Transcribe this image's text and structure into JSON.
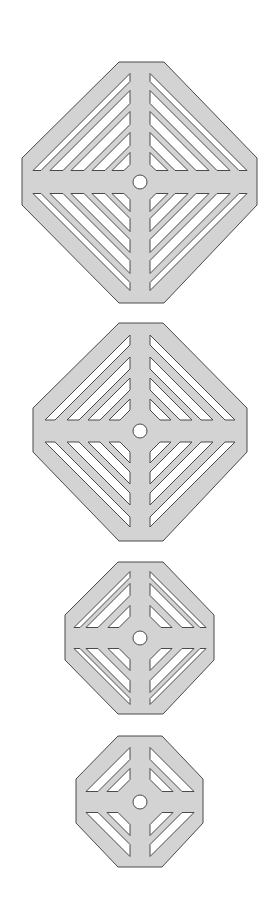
{
  "diagram": {
    "title": "Octagonal drain grate plates with diagonal slots",
    "colors": {
      "plate_fill": "#d3d3d3",
      "outline": "#4a4a4a",
      "slot_fill": "#ffffff",
      "background": "#ffffff"
    },
    "plates": [
      {
        "label": "Plate 1 (large)",
        "slots_per_quadrant": 5,
        "outline": {
          "top": 62,
          "bottom": 303,
          "left": 22,
          "right": 257,
          "top_flat_x": [
            119,
            164
          ],
          "side_flat_y": [
            158,
            205
          ]
        },
        "center": [
          140,
          182
        ],
        "bar": {
          "v_half": 10,
          "h_half": 11.5
        },
        "hole_r": 7,
        "slots": [
          {
            "d": 97,
            "w": 8
          },
          {
            "d": 80,
            "w": 13
          },
          {
            "d": 59,
            "w": 13
          },
          {
            "d": 38,
            "w": 13
          },
          {
            "d": 18,
            "w": 12
          }
        ]
      },
      {
        "label": "Plate 2",
        "slots_per_quadrant": 4,
        "outline": {
          "top": 323,
          "bottom": 541,
          "left": 33,
          "right": 247,
          "top_flat_x": [
            119,
            163
          ],
          "side_flat_y": [
            408,
            452
          ]
        },
        "center": [
          140,
          431
        ],
        "bar": {
          "v_half": 10,
          "h_half": 11
        },
        "hole_r": 7,
        "slots": [
          {
            "d": 85,
            "w": 10
          },
          {
            "d": 63,
            "w": 12
          },
          {
            "d": 42,
            "w": 12
          },
          {
            "d": 21,
            "w": 11
          }
        ]
      },
      {
        "label": "Plate 3",
        "slots_per_quadrant": 3,
        "outline": {
          "top": 562,
          "bottom": 714,
          "left": 65,
          "right": 214,
          "top_flat_x": [
            118,
            163
          ],
          "side_flat_y": [
            615,
            660
          ]
        },
        "center": [
          140,
          638
        ],
        "bar": {
          "v_half": 10,
          "h_half": 10.5
        },
        "hole_r": 7,
        "slots": [
          {
            "d": 56,
            "w": 6
          },
          {
            "d": 44,
            "w": 12
          },
          {
            "d": 22,
            "w": 11
          }
        ]
      },
      {
        "label": "Plate 4 (small)",
        "slots_per_quadrant": 2,
        "outline": {
          "top": 736,
          "bottom": 867,
          "left": 76,
          "right": 203,
          "top_flat_x": [
            118,
            162
          ],
          "side_flat_y": [
            779,
            823
          ]
        },
        "center": [
          140,
          802
        ],
        "bar": {
          "v_half": 10,
          "h_half": 10.5
        },
        "hole_r": 7,
        "slots": [
          {
            "d": 44,
            "w": 12
          },
          {
            "d": 23,
            "w": 11
          }
        ]
      }
    ]
  }
}
